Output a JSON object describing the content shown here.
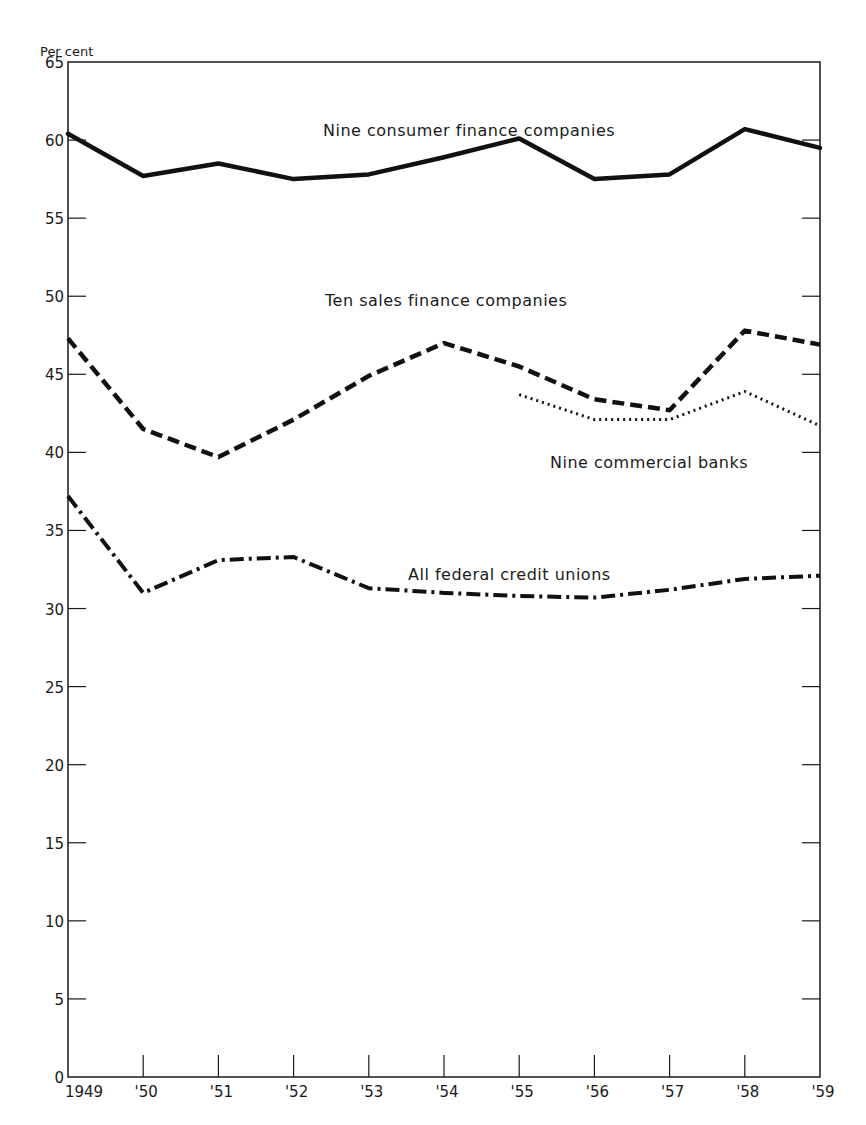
{
  "chart_data": {
    "type": "line",
    "title": "",
    "ylabel": "Per cent",
    "xlabel": "",
    "ylim": [
      0,
      65
    ],
    "yticks": [
      0,
      5,
      10,
      15,
      20,
      25,
      30,
      35,
      40,
      45,
      50,
      55,
      60,
      65
    ],
    "categories": [
      "1949",
      "'50",
      "'51",
      "'52",
      "'53",
      "'54",
      "'55",
      "'56",
      "'57",
      "'58",
      "'59"
    ],
    "grid": false,
    "legend": "inline labels",
    "series": [
      {
        "name": "Nine consumer finance companies",
        "style": "solid",
        "values": [
          60.4,
          57.7,
          58.5,
          57.5,
          57.8,
          58.9,
          60.1,
          57.5,
          57.8,
          60.7,
          59.5
        ]
      },
      {
        "name": "Ten sales finance companies",
        "style": "dashed",
        "values": [
          47.3,
          41.5,
          39.7,
          42.1,
          44.9,
          47.0,
          45.5,
          43.4,
          42.7,
          47.8,
          46.9
        ]
      },
      {
        "name": "Nine commercial banks",
        "style": "dotted",
        "values": [
          null,
          null,
          null,
          null,
          null,
          null,
          43.7,
          42.1,
          42.1,
          43.9,
          41.7
        ]
      },
      {
        "name": "All federal credit unions",
        "style": "dash-dot",
        "values": [
          37.2,
          31.0,
          33.1,
          33.3,
          31.3,
          31.0,
          30.8,
          30.7,
          31.2,
          31.9,
          32.1
        ]
      }
    ]
  },
  "labels": {
    "unit": "Per cent",
    "consumer": "Nine consumer finance companies",
    "sales": "Ten sales finance companies",
    "banks": "Nine commercial banks",
    "credit_unions": "All federal credit unions"
  },
  "yticks": [
    "0",
    "5",
    "10",
    "15",
    "20",
    "25",
    "30",
    "35",
    "40",
    "45",
    "50",
    "55",
    "60",
    "65"
  ],
  "xticks": [
    "1949",
    "'50",
    "'51",
    "'52",
    "'53",
    "'54",
    "'55",
    "'56",
    "'57",
    "'58",
    "'59"
  ]
}
